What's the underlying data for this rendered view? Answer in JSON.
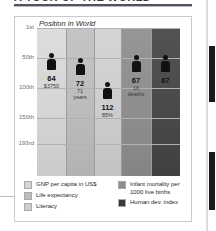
{
  "document": {
    "heading": "A TOUR OF THE WORLD"
  },
  "chart_data": {
    "type": "bar",
    "title": "Position in World",
    "xlabel": "",
    "ylabel": "Position in World",
    "grid": true,
    "axis_inverted": true,
    "ylim": [
      "1st",
      "193rd"
    ],
    "ytick_labels": [
      "1st",
      "50th",
      "100th",
      "150th",
      "193rd"
    ],
    "ytick_values": [
      1,
      50,
      100,
      150,
      193
    ],
    "legend_position": "bottom",
    "categories": [
      "GNP per capita in US$",
      "Life expectancy",
      "Literacy",
      "Infant mortality per 1000 live births",
      "Human dev. index"
    ],
    "values": [
      64,
      72,
      112,
      67,
      67
    ],
    "rank_labels": [
      "64",
      "72",
      "112",
      "67",
      "67"
    ],
    "detail_labels": [
      "$3750",
      "71 years",
      "85%",
      "16 deaths",
      ""
    ],
    "column_colors": [
      "#d5d5d5",
      "#bcbcbc",
      "#cdcdcd",
      "#8e8e8e",
      "#4a4a4a"
    ],
    "marker": "person-icon"
  },
  "chart": {
    "title": "Position in World",
    "axis": {
      "ticks": [
        {
          "label": "1st",
          "value": 1
        },
        {
          "label": "50th",
          "value": 50
        },
        {
          "label": "100th",
          "value": 100
        },
        {
          "label": "150th",
          "value": 150
        },
        {
          "label": "193rd",
          "value": 193
        }
      ]
    },
    "bars": [
      {
        "name": "gnp",
        "rank": "64",
        "detail": "$3750",
        "detail2": "",
        "value": 64,
        "color": "#d5d5d5"
      },
      {
        "name": "life",
        "rank": "72",
        "detail": "71",
        "detail2": "years",
        "value": 72,
        "color": "#bcbcbc"
      },
      {
        "name": "literacy",
        "rank": "112",
        "detail": "85%",
        "detail2": "",
        "value": 112,
        "color": "#cdcdcd"
      },
      {
        "name": "mortality",
        "rank": "67",
        "detail": "16",
        "detail2": "deaths",
        "value": 67,
        "color": "#8e8e8e"
      },
      {
        "name": "hdi",
        "rank": "67",
        "detail": "",
        "detail2": "",
        "value": 67,
        "color": "#4a4a4a"
      }
    ]
  },
  "legend": {
    "left": [
      {
        "label": "GNP per capita in US$",
        "color": "#d5d5d5"
      },
      {
        "label": "Life expectancy",
        "color": "#bcbcbc"
      },
      {
        "label": "Literacy",
        "color": "#cdcdcd"
      }
    ],
    "right": [
      {
        "label": "Infant mortality per",
        "label2": "1000 live births",
        "color": "#8e8e8e"
      },
      {
        "label": "Human dev. index",
        "label2": "",
        "color": "#3a3a3a"
      }
    ]
  },
  "scrollbar": {
    "thumb1_top": 46,
    "thumb1_height": 56,
    "thumb2_top": 152,
    "thumb2_height": 58
  }
}
